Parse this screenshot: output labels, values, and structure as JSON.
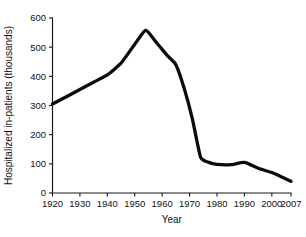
{
  "chart_data": {
    "type": "line",
    "title": "",
    "xlabel": "Year",
    "ylabel": "Hospitalized in-patients (thousands)",
    "xlim": [
      1920,
      2007
    ],
    "ylim": [
      0,
      600
    ],
    "grid": false,
    "legend": false,
    "xticks": [
      1920,
      1930,
      1940,
      1950,
      1960,
      1970,
      1980,
      1990,
      2000,
      2007
    ],
    "xtick_labels": [
      "1920",
      "1930",
      "1940",
      "1950",
      "1960",
      "1970",
      "1980",
      "1990",
      "2000",
      "2007"
    ],
    "yticks": [
      0,
      100,
      200,
      300,
      400,
      500,
      600
    ],
    "ytick_labels": [
      "0",
      "100",
      "200",
      "300",
      "400",
      "500",
      "600"
    ],
    "series": [
      {
        "name": "Hospitalized in-patients",
        "color": "#0b0b0b",
        "x": [
          1920,
          1930,
          1935,
          1940,
          1945,
          1950,
          1954,
          1958,
          1962,
          1965,
          1968,
          1971,
          1974,
          1977,
          1980,
          1985,
          1990,
          1995,
          2000,
          2007
        ],
        "values": [
          305,
          355,
          380,
          405,
          445,
          510,
          558,
          515,
          470,
          440,
          360,
          255,
          123,
          105,
          98,
          97,
          105,
          85,
          70,
          40
        ]
      }
    ]
  }
}
